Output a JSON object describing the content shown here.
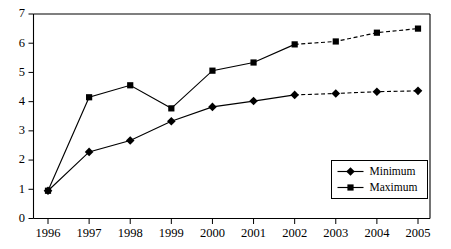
{
  "chart_data": {
    "type": "line",
    "title": "",
    "subtitle": "",
    "xlabel": "",
    "ylabel": "",
    "categories": [
      "1996",
      "1997",
      "1998",
      "1999",
      "2000",
      "2001",
      "2002",
      "2003",
      "2004",
      "2005"
    ],
    "x": [
      1996,
      1997,
      1998,
      1999,
      2000,
      2001,
      2002,
      2003,
      2004,
      2005
    ],
    "series": [
      {
        "name": "Minimum",
        "marker": "diamond",
        "values": [
          0.95,
          2.28,
          2.67,
          3.33,
          3.82,
          4.02,
          4.23,
          4.28,
          4.34,
          4.37
        ],
        "solid_through": 2002,
        "dashed_from": 2002
      },
      {
        "name": "Maximum",
        "marker": "square",
        "values": [
          0.95,
          4.15,
          4.56,
          3.77,
          5.06,
          5.34,
          5.96,
          6.06,
          6.36,
          6.5
        ],
        "solid_through": 2002,
        "dashed_from": 2002
      }
    ],
    "ylim": [
      0,
      7
    ],
    "yticks": [
      "0",
      "1",
      "2",
      "3",
      "4",
      "5",
      "6",
      "7"
    ],
    "xticks": [
      "1996",
      "1997",
      "1998",
      "1999",
      "2000",
      "2001",
      "2002",
      "2003",
      "2004",
      "2005"
    ],
    "grid": false,
    "legend": {
      "position": "bottom-right",
      "entries": [
        {
          "label": "Minimum",
          "marker": "diamond",
          "linestyle": "solid"
        },
        {
          "label": "Maximum",
          "marker": "square",
          "linestyle": "solid"
        }
      ]
    },
    "colors": {
      "series": "#000000",
      "axis": "#000000",
      "background": "#ffffff"
    }
  }
}
